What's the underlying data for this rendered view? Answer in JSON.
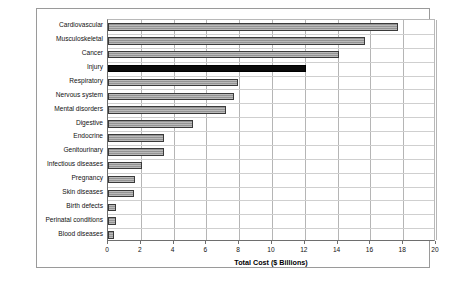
{
  "chart_data": {
    "type": "bar",
    "orientation": "horizontal",
    "title": "",
    "xlabel": "Total Cost ($ Billions)",
    "ylabel": "",
    "xlim": [
      0,
      20
    ],
    "xticks": [
      0,
      2,
      4,
      6,
      8,
      10,
      12,
      14,
      16,
      18,
      20
    ],
    "xtick_labels": [
      "0",
      "2",
      "4",
      "6",
      "8",
      "10",
      "12",
      "14",
      "16",
      "18",
      "20"
    ],
    "grid": "vertical",
    "legend": "none",
    "categories": [
      "Cardiovascular",
      "Musculoskeletal",
      "Cancer",
      "Injury",
      "Respiratory",
      "Nervous system",
      "Mental disorders",
      "Digestive",
      "Endocrine",
      "Genitourinary",
      "Infectious diseases",
      "Pregnancy",
      "Skin diseases",
      "Birth defects",
      "Perinatal conditions",
      "Blood diseases"
    ],
    "values": [
      17.7,
      15.7,
      14.1,
      12.1,
      7.9,
      7.7,
      7.2,
      5.2,
      3.4,
      3.4,
      2.05,
      1.65,
      1.6,
      0.5,
      0.5,
      0.35
    ],
    "highlight_category": "Injury",
    "colors": {
      "bar": "#9d9d9d",
      "bar_border": "#3a3a3a",
      "highlight_bar": "#0a0a0a",
      "gridline": "#b5b5b5",
      "axis": "#6e6e6e",
      "frame": "#9a9a9a",
      "background": "#ffffff",
      "text": "#111111"
    }
  }
}
